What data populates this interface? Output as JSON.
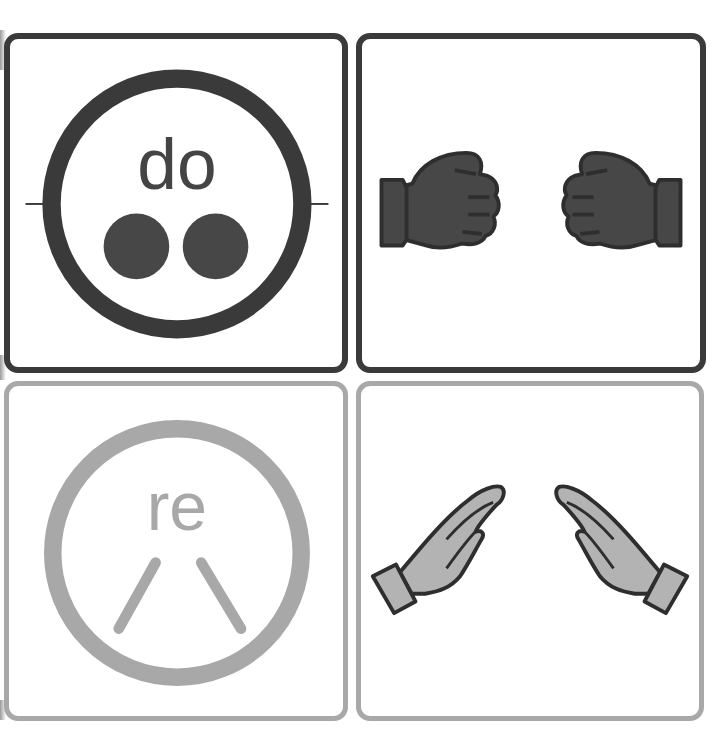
{
  "colors": {
    "dark": "#3a3a3a",
    "dark_fill": "#474747",
    "light": "#a8a8a8",
    "light_fill": "#b3b3b3",
    "background": "#ffffff"
  },
  "cards": [
    {
      "id": "do-symbol",
      "syllable": "do",
      "glyph": "two-dots",
      "row": 1,
      "col": 1,
      "tone": "dark"
    },
    {
      "id": "do-gesture",
      "gesture": "two-fists",
      "row": 1,
      "col": 2,
      "tone": "dark"
    },
    {
      "id": "re-symbol",
      "syllable": "re",
      "glyph": "inverted-v-lines",
      "row": 2,
      "col": 1,
      "tone": "light"
    },
    {
      "id": "re-gesture",
      "gesture": "hands-angled-upward",
      "row": 2,
      "col": 2,
      "tone": "light"
    }
  ]
}
